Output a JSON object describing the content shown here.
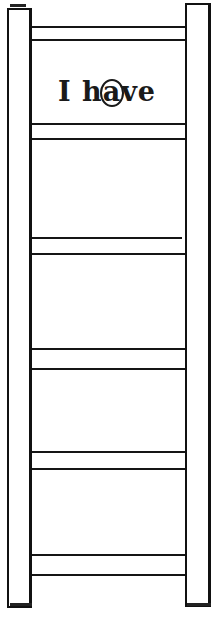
{
  "image": {
    "description": "Line drawing of a ladder with six pairs of rungs; the top space between rungs contains a text label",
    "label": {
      "prefix": "I h",
      "circled_letter": "a",
      "suffix": "ve",
      "full_text": "I have"
    },
    "rung_pairs": 6,
    "colors": {
      "line": "#111111",
      "background": "#ffffff"
    }
  }
}
